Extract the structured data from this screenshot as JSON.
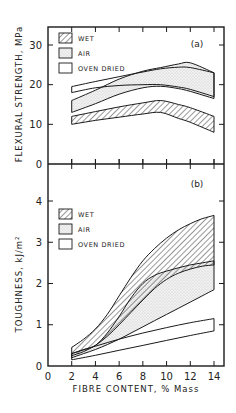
{
  "chart_data": [
    {
      "type": "area",
      "panel_label": "(a)",
      "title": "",
      "xlabel": "FIBRE CONTENT, % Mass",
      "ylabel": "FLEXURAL STRENGTH, MPa",
      "xlim": [
        0,
        14
      ],
      "ylim": [
        0,
        35
      ],
      "x_ticks": [
        0,
        2,
        4,
        6,
        8,
        10,
        12,
        14
      ],
      "y_ticks": [
        0,
        10,
        20,
        30
      ],
      "y_tick_labels": [
        "0",
        "10",
        "20",
        "30"
      ],
      "grid": false,
      "legend": {
        "placement": "top-left",
        "entries": [
          {
            "label": "WET",
            "pattern": "hatch"
          },
          {
            "label": "AIR",
            "pattern": "dots"
          },
          {
            "label": "OVEN DRIED",
            "pattern": "blank"
          }
        ]
      },
      "series": [
        {
          "name": "WET",
          "pattern": "hatch",
          "x": [
            2,
            4,
            6,
            8,
            9.5,
            11,
            12,
            14
          ],
          "upper": [
            12,
            13.2,
            14.4,
            15.4,
            16,
            15,
            14.2,
            12
          ],
          "lower": [
            10,
            11,
            11.8,
            12.6,
            13,
            11.5,
            10.5,
            8
          ]
        },
        {
          "name": "AIR",
          "pattern": "dots",
          "x": [
            2,
            4,
            6,
            8,
            9.5,
            11,
            12,
            14
          ],
          "upper": [
            16,
            18.6,
            21.4,
            23.4,
            24.3,
            25.2,
            25.5,
            23
          ],
          "lower": [
            13,
            15.2,
            17.6,
            19.2,
            19.6,
            19,
            18.3,
            16.5
          ]
        },
        {
          "name": "OVEN DRIED",
          "pattern": "blank",
          "x": [
            2,
            4,
            6,
            8,
            9.5,
            11,
            12,
            14
          ],
          "upper": [
            19.5,
            20.8,
            22,
            23.2,
            24,
            24.4,
            24.3,
            23
          ],
          "lower": [
            18,
            19.2,
            19.8,
            20,
            20,
            19.4,
            18.8,
            17
          ]
        }
      ]
    },
    {
      "type": "area",
      "panel_label": "(b)",
      "title": "",
      "xlabel": "FIBRE CONTENT, % Mass",
      "ylabel": "TOUGHNESS, kJ/m²",
      "xlim": [
        0,
        14
      ],
      "ylim": [
        0,
        4.5
      ],
      "x_ticks": [
        0,
        2,
        4,
        6,
        8,
        10,
        12,
        14
      ],
      "x_tick_labels": [
        "0",
        "2",
        "4",
        "6",
        "8",
        "10",
        "12",
        "14"
      ],
      "y_ticks": [
        0,
        1,
        2,
        3,
        4
      ],
      "y_tick_labels": [
        "0",
        "1",
        "2",
        "3",
        "4"
      ],
      "grid": false,
      "legend": {
        "placement": "top-left",
        "entries": [
          {
            "label": "WET",
            "pattern": "hatch"
          },
          {
            "label": "AIR",
            "pattern": "dots"
          },
          {
            "label": "OVEN DRIED",
            "pattern": "blank"
          }
        ]
      },
      "series": [
        {
          "name": "WET",
          "pattern": "hatch",
          "x": [
            2,
            3,
            4,
            5,
            6,
            7,
            8,
            9,
            10,
            11,
            12,
            13,
            14
          ],
          "upper": [
            0.45,
            0.65,
            0.9,
            1.25,
            1.7,
            2.15,
            2.55,
            2.85,
            3.1,
            3.3,
            3.45,
            3.57,
            3.65
          ],
          "lower": [
            0.25,
            0.35,
            0.5,
            0.72,
            1.0,
            1.3,
            1.6,
            1.88,
            2.1,
            2.25,
            2.35,
            2.42,
            2.45
          ]
        },
        {
          "name": "AIR",
          "pattern": "dots",
          "x": [
            2,
            3,
            4,
            5,
            6,
            7,
            8,
            9,
            10,
            11,
            12,
            13,
            14
          ],
          "upper": [
            0.3,
            0.4,
            0.5,
            0.8,
            1.2,
            1.65,
            2.0,
            2.2,
            2.3,
            2.38,
            2.45,
            2.5,
            2.55
          ],
          "lower": [
            0.2,
            0.3,
            0.4,
            0.52,
            0.65,
            0.8,
            0.95,
            1.1,
            1.25,
            1.4,
            1.55,
            1.7,
            1.85
          ]
        },
        {
          "name": "OVEN DRIED",
          "pattern": "blank",
          "x": [
            2,
            4,
            6,
            8,
            10,
            12,
            14
          ],
          "upper": [
            0.3,
            0.48,
            0.65,
            0.8,
            0.93,
            1.05,
            1.15
          ],
          "lower": [
            0.15,
            0.26,
            0.38,
            0.5,
            0.62,
            0.74,
            0.85
          ]
        }
      ]
    }
  ]
}
